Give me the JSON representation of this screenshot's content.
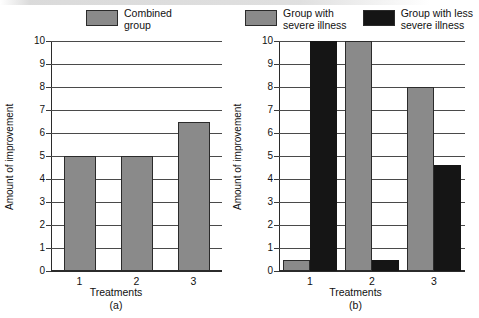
{
  "chart_data": [
    {
      "type": "bar",
      "panel": "(a)",
      "title": "",
      "categories": [
        "1",
        "2",
        "3"
      ],
      "series": [
        {
          "name": "Combined group",
          "values": [
            5,
            5,
            6.5
          ],
          "color": "#8a8a8a"
        }
      ],
      "legend": [
        {
          "label": "Combined\ngroup",
          "color": "#8a8a8a",
          "swatch": "gray"
        }
      ],
      "xlabel": "Treatments",
      "ylabel": "Amount of improvement",
      "ylim": [
        0,
        10
      ],
      "yticks": [
        0,
        1,
        2,
        3,
        4,
        5,
        6,
        7,
        8,
        9,
        10
      ],
      "ytick_labels": [
        "0",
        "1",
        "2",
        "3",
        "4",
        "5",
        "6",
        "7",
        "8",
        "9",
        "10"
      ],
      "grid": true,
      "legend_position": "top-center"
    },
    {
      "type": "bar",
      "panel": "(b)",
      "title": "",
      "categories": [
        "1",
        "2",
        "3"
      ],
      "series": [
        {
          "name": "Group with severe illness",
          "values": [
            0.5,
            10,
            8
          ],
          "color": "#8a8a8a"
        },
        {
          "name": "Group with less severe illness",
          "values": [
            10,
            0.5,
            4.6
          ],
          "color": "#151515"
        }
      ],
      "legend": [
        {
          "label": "Group with\nsevere illness",
          "color": "#8a8a8a",
          "swatch": "gray"
        },
        {
          "label": "Group with less\nsevere illness",
          "color": "#151515",
          "swatch": "black"
        }
      ],
      "xlabel": "Treatments",
      "ylabel": "Amount of improvement",
      "ylim": [
        0,
        10
      ],
      "yticks": [
        0,
        1,
        2,
        3,
        4,
        5,
        6,
        7,
        8,
        9,
        10
      ],
      "ytick_labels": [
        "0",
        "1",
        "2",
        "3",
        "4",
        "5",
        "6",
        "7",
        "8",
        "9",
        "10"
      ],
      "grid": true,
      "legend_position": "top-center"
    }
  ],
  "colors": {
    "series_gray": "#8a8a8a",
    "series_black": "#151515",
    "axis": "#2b2b2b",
    "grid": "#4a4a4a",
    "background": "#ffffff"
  }
}
